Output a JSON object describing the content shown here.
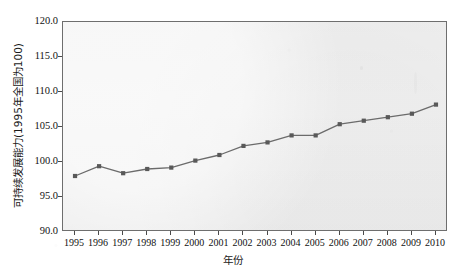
{
  "chart_data": {
    "type": "line",
    "title": "",
    "xlabel": "年份",
    "ylabel": "可持续发展能力(1995年全国为100)",
    "categories": [
      "1995",
      "1996",
      "1997",
      "1998",
      "1999",
      "2000",
      "2001",
      "2002",
      "2003",
      "2004",
      "2005",
      "2006",
      "2007",
      "2008",
      "2009",
      "2010"
    ],
    "values": [
      98.0,
      99.4,
      98.4,
      99.0,
      99.2,
      100.2,
      101.0,
      102.3,
      102.8,
      103.8,
      103.8,
      105.4,
      105.9,
      106.4,
      106.9,
      108.2
    ],
    "series": [
      {
        "name": "可持续发展能力",
        "values": [
          98.0,
          99.4,
          98.4,
          99.0,
          99.2,
          100.2,
          101.0,
          102.3,
          102.8,
          103.8,
          103.8,
          105.4,
          105.9,
          106.4,
          106.9,
          108.2
        ]
      }
    ],
    "ylim": [
      90.0,
      120.0
    ],
    "yticks": [
      90.0,
      95.0,
      100.0,
      105.0,
      110.0,
      115.0,
      120.0
    ],
    "ytick_labels": [
      "90.0",
      "95.0",
      "100.0",
      "105.0",
      "110.0",
      "115.0",
      "120.0"
    ],
    "xlim": [
      "1995",
      "2010"
    ],
    "grid": false,
    "legend": "none",
    "marker": "square",
    "line_color": "#6b6b6b",
    "marker_color": "#595959",
    "plot_background": "#f1f1f1",
    "axis_color": "#6e6e6e",
    "figure_background": "#ffffff"
  }
}
